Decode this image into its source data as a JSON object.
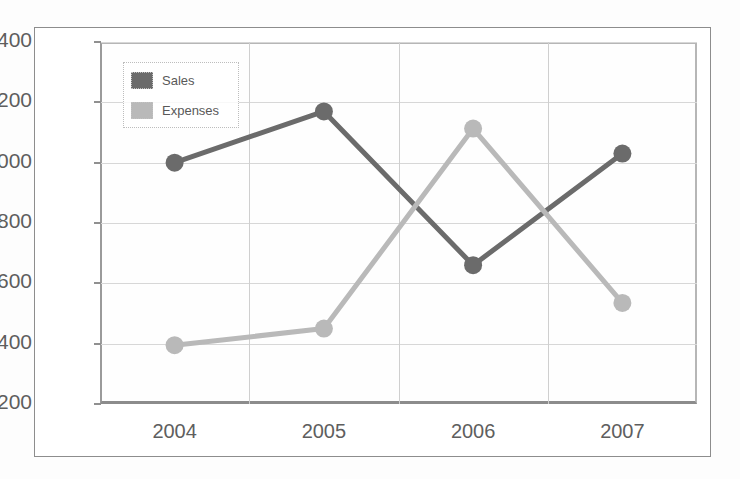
{
  "chart_data": {
    "type": "line",
    "title": "",
    "xlabel": "",
    "ylabel": "",
    "categories": [
      "2004",
      "2005",
      "2006",
      "2007"
    ],
    "x_tick_labels": [
      "2004",
      "2005",
      "2006",
      "2007"
    ],
    "y_tick_labels": [
      "200",
      "400",
      "600",
      "800",
      "1000",
      "1200",
      "1400"
    ],
    "y_ticks": [
      200,
      400,
      600,
      800,
      1000,
      1200,
      1400
    ],
    "ylim": [
      200,
      1400
    ],
    "grid": true,
    "legend_position": "top-left-inside",
    "series": [
      {
        "name": "Sales",
        "color": "#6b6b6b",
        "marker": "circle",
        "values": [
          1000,
          1170,
          660,
          1030
        ]
      },
      {
        "name": "Expenses",
        "color": "#b9b9b9",
        "marker": "circle",
        "values": [
          395,
          450,
          1113,
          535
        ]
      }
    ]
  },
  "legend": {
    "items": [
      {
        "label": "Sales",
        "color": "#6b6b6b"
      },
      {
        "label": "Expenses",
        "color": "#b9b9b9"
      }
    ]
  },
  "axis": {
    "y_labels": [
      "1400",
      "1200",
      "1000",
      "800",
      "600",
      "400",
      "200"
    ],
    "x_labels": [
      "2004",
      "2005",
      "2006",
      "2007"
    ]
  },
  "colors": {
    "sales": "#6b6b6b",
    "expenses": "#b9b9b9",
    "grid": "#d7d7d7",
    "axis": "#909090",
    "tick_text": "#5e5e5e",
    "frame": "#8d8d8d",
    "plot_background": "#fefefe"
  }
}
